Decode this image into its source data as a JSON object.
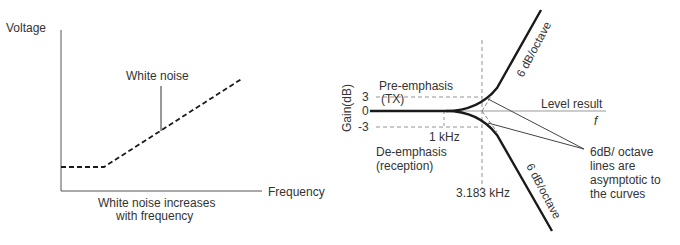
{
  "left_diagram": {
    "y_axis_label": "Voltage",
    "x_axis_label": "Frequency",
    "curve_label": "White noise",
    "caption_line1": "White noise increases",
    "caption_line2": "with frequency"
  },
  "right_diagram": {
    "y_axis_label": "Gain(dB)",
    "y_ticks": [
      "3",
      "0",
      "-3"
    ],
    "x_axis_symbol": "f",
    "pre_emphasis_line1": "Pre-emphasis",
    "pre_emphasis_line2": "(TX)",
    "de_emphasis_line1": "De-emphasis",
    "de_emphasis_line2": "(reception)",
    "marker_1khz": "1 kHz",
    "marker_3183khz": "3.183 kHz",
    "level_result": "Level result",
    "slope_upper": "6 dB/octave",
    "slope_lower": "6 dB/octave",
    "note_line1": "6dB/ octave",
    "note_line2": "lines are",
    "note_line3": "asymptotic to",
    "note_line4": "the curves"
  },
  "colors": {
    "curve": "#1a1a1a",
    "axis": "#555555",
    "dashed_guide": "#888888",
    "text": "#333333"
  }
}
